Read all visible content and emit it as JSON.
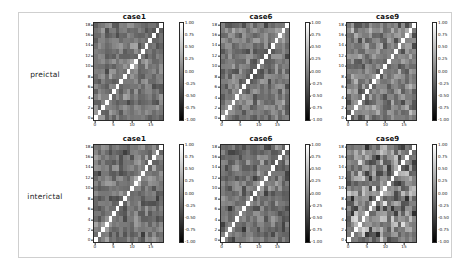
{
  "figure": {
    "background": "#ffffff",
    "frame_color": "#cfcfcf",
    "row_labels": [
      "preictal",
      "interictal"
    ],
    "column_titles": [
      "case1",
      "case6",
      "case9"
    ]
  },
  "chart_data": {
    "type": "heatmap",
    "title": "",
    "colormap": "gray",
    "grid": false,
    "legend_position": "right-colorbar",
    "colorbar": {
      "vmin": -1.0,
      "vmax": 1.0,
      "tick_labels": [
        "1.00",
        "0.75",
        "0.50",
        "0.25",
        "0.00",
        "-0.25",
        "-0.50",
        "-0.75",
        "-1.00"
      ],
      "tick_values": [
        1.0,
        0.75,
        0.5,
        0.25,
        0.0,
        -0.25,
        -0.5,
        -0.75,
        -1.0
      ],
      "low_color": "#000000",
      "high_color": "#ffffff"
    },
    "xlabel": "",
    "ylabel": "",
    "xlim": [
      0,
      19
    ],
    "ylim": [
      0,
      19
    ],
    "xtick_labels": [
      "0",
      "5",
      "10",
      "15"
    ],
    "xtick_values": [
      0,
      5,
      10,
      15
    ],
    "ytick_labels": [
      "18",
      "16",
      "14",
      "12",
      "10",
      "8",
      "6",
      "4",
      "2",
      "0"
    ],
    "ytick_values": [
      18,
      16,
      14,
      12,
      10,
      8,
      6,
      4,
      2,
      0
    ],
    "matrix_size": 19,
    "panels": [
      {
        "row": "preictal",
        "column": "case1",
        "title": "case1",
        "diagonal_value": 1.0,
        "mean_value": -0.05,
        "contrast": 0.3,
        "seed": 11
      },
      {
        "row": "preictal",
        "column": "case6",
        "title": "case6",
        "diagonal_value": 1.0,
        "mean_value": -0.06,
        "contrast": 0.34,
        "seed": 61
      },
      {
        "row": "preictal",
        "column": "case9",
        "title": "case9",
        "diagonal_value": 1.0,
        "mean_value": -0.04,
        "contrast": 0.4,
        "seed": 91
      },
      {
        "row": "interictal",
        "column": "case1",
        "title": "case1",
        "diagonal_value": 1.0,
        "mean_value": -0.1,
        "contrast": 0.32,
        "seed": 12
      },
      {
        "row": "interictal",
        "column": "case6",
        "title": "case6",
        "diagonal_value": 1.0,
        "mean_value": -0.08,
        "contrast": 0.36,
        "seed": 62
      },
      {
        "row": "interictal",
        "column": "case9",
        "title": "case9",
        "diagonal_value": 1.0,
        "mean_value": -0.02,
        "contrast": 0.62,
        "seed": 92
      }
    ]
  }
}
